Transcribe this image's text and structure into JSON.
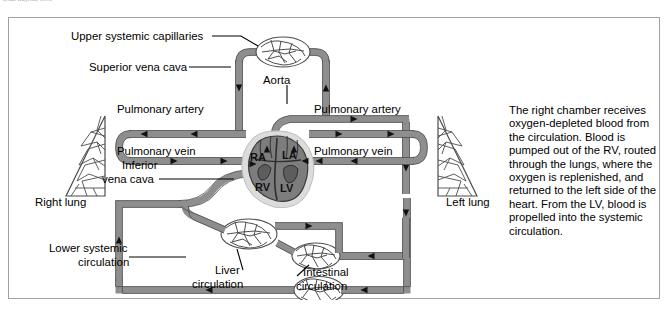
{
  "figure": {
    "cut_citation": "from Guyton, 1991",
    "frame_border_color": "#a2a2a2",
    "vessel_color": "#8e8e8e",
    "vessel_outline_color": "#555555",
    "heart_fill_color": "#7d7d7d",
    "background_color": "#ffffff"
  },
  "labels": {
    "upper_systemic_capillaries": "Upper systemic capillaries",
    "superior_vena_cava": "Superior vena cava",
    "aorta": "Aorta",
    "pulmonary_artery_left": "Pulmonary artery",
    "pulmonary_artery_right": "Pulmonary artery",
    "pulmonary_vein_left": "Pulmonary vein",
    "pulmonary_vein_right": "Pulmonary vein",
    "inferior_vena_cava_line1": "Inferior",
    "inferior_vena_cava_line2": "vena cava",
    "right_lung": "Right lung",
    "left_lung": "Left lung",
    "lower_systemic_line1": "Lower systemic",
    "lower_systemic_line2": "circulation",
    "liver_line1": "Liver",
    "liver_line2": "circulation",
    "intestinal_line1": "Intestinal",
    "intestinal_line2": "circulation"
  },
  "heart_chambers": {
    "right_atrium": "RA",
    "left_atrium": "LA",
    "right_ventricle": "RV",
    "left_ventricle": "LV"
  },
  "side_note": {
    "text": "The right chamber receives oxygen-depleted blood from the circulation. Blood is pumped out of the RV, routed through the lungs, where the oxygen is replenished, and returned to the left side of the heart. From the LV, blood is propelled into the systemic circulation."
  }
}
